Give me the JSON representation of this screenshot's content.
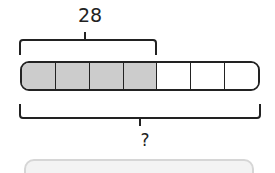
{
  "diagram": {
    "type": "tape-diagram",
    "top_label": "28",
    "bottom_label": "?",
    "total_parts": 7,
    "shaded_parts": 4,
    "colors": {
      "shaded": "#cccccc",
      "unshaded": "#ffffff",
      "stroke": "#222222"
    }
  },
  "answer_box": {
    "value": ""
  }
}
